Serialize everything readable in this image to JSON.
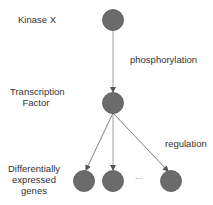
{
  "diagram": {
    "levels": {
      "kinase": "Kinase X",
      "tf_line1": "Transcription",
      "tf_line2": "Factor",
      "genes_line1": "Differentially",
      "genes_line2": "expressed",
      "genes_line3": "genes"
    },
    "edges": {
      "phosphorylation": "phosphorylation",
      "regulation": "regulation"
    },
    "ellipsis": "...",
    "colors": {
      "node_fill": "#6b6b6b",
      "node_stroke": "#555555",
      "edge": "#9a9a9a",
      "text": "#333333"
    }
  }
}
